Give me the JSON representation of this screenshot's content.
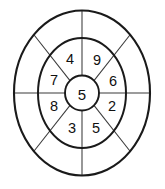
{
  "figure": {
    "kind": "concentric-ring-number-wheel",
    "background_color": "#ffffff",
    "stroke_color": "#1a1a1a",
    "spoke_color": "#3a3a3a",
    "text_color": "#101010",
    "center": {
      "cx": 82,
      "cy": 93
    },
    "rings": [
      {
        "name": "outer-ring",
        "rx": 68,
        "ry": 82.5,
        "labelled": false
      },
      {
        "name": "middle-ring",
        "rx": 44,
        "ry": 55,
        "labelled": true
      },
      {
        "name": "inner-circle",
        "rx": 17,
        "ry": 17.5,
        "labelled": true
      }
    ],
    "spokes": [
      {
        "name": "spoke-top",
        "angle_deg": 270
      },
      {
        "name": "spoke-upper-right",
        "angle_deg": 315
      },
      {
        "name": "spoke-right",
        "angle_deg": 0
      },
      {
        "name": "spoke-lower-right",
        "angle_deg": 45
      },
      {
        "name": "spoke-bottom",
        "angle_deg": 90
      },
      {
        "name": "spoke-lower-left",
        "angle_deg": 135
      },
      {
        "name": "spoke-left",
        "angle_deg": 180
      },
      {
        "name": "spoke-upper-left",
        "angle_deg": 225
      }
    ]
  },
  "center_cell": {
    "name": "center-cell",
    "value": "5"
  },
  "middle_cells": [
    {
      "name": "middle-cell-top-left",
      "value": "4",
      "x": 70,
      "y": 59,
      "angle_deg": 247.5
    },
    {
      "name": "middle-cell-top-right",
      "value": "9",
      "x": 97,
      "y": 60,
      "angle_deg": 292.5
    },
    {
      "name": "middle-cell-right-upper",
      "value": "6",
      "x": 113,
      "y": 81,
      "angle_deg": 337.5
    },
    {
      "name": "middle-cell-right-lower",
      "value": "2",
      "x": 112,
      "y": 106,
      "angle_deg": 22.5
    },
    {
      "name": "middle-cell-bottom-right",
      "value": "5",
      "x": 96,
      "y": 128,
      "angle_deg": 67.5
    },
    {
      "name": "middle-cell-bottom-left",
      "value": "3",
      "x": 72,
      "y": 128,
      "angle_deg": 112.5
    },
    {
      "name": "middle-cell-left-lower",
      "value": "8",
      "x": 54,
      "y": 106,
      "angle_deg": 157.5
    },
    {
      "name": "middle-cell-left-upper",
      "value": "7",
      "x": 54,
      "y": 80,
      "angle_deg": 202.5
    }
  ],
  "outer_cells": [
    {
      "name": "outer-cell-1",
      "value": ""
    },
    {
      "name": "outer-cell-2",
      "value": ""
    },
    {
      "name": "outer-cell-3",
      "value": ""
    },
    {
      "name": "outer-cell-4",
      "value": ""
    },
    {
      "name": "outer-cell-5",
      "value": ""
    },
    {
      "name": "outer-cell-6",
      "value": ""
    },
    {
      "name": "outer-cell-7",
      "value": ""
    },
    {
      "name": "outer-cell-8",
      "value": ""
    }
  ]
}
